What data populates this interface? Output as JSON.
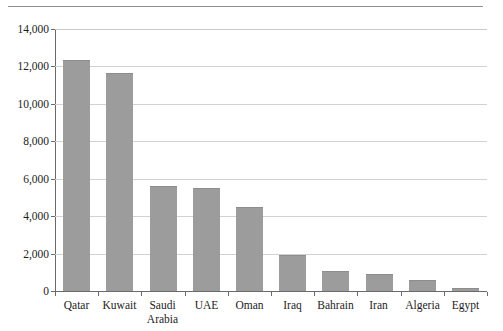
{
  "figure": {
    "has_top_rule": true,
    "background_color": "#ffffff",
    "bar_color": "#9c9c9c",
    "gridline_color": "#d2d2d2",
    "axis_color": "#6a6a6a"
  },
  "chart_data": {
    "type": "bar",
    "title": "",
    "subtitle": "",
    "xlabel": "",
    "ylabel": "",
    "categories": [
      "Qatar",
      "Kuwait",
      "Saudi\nArabia",
      "UAE",
      "Oman",
      "Iraq",
      "Bahrain",
      "Iran",
      "Algeria",
      "Egypt"
    ],
    "values": [
      12350,
      11650,
      5600,
      5480,
      4500,
      1950,
      1070,
      900,
      600,
      160
    ],
    "ylim": [
      0,
      14000
    ],
    "yticks": [
      0,
      2000,
      4000,
      6000,
      8000,
      10000,
      12000,
      14000
    ],
    "ytick_labels": [
      "0",
      "2,000",
      "4,000",
      "6,000",
      "8,000",
      "10,000",
      "12,000",
      "14,000"
    ],
    "grid": true,
    "legend": null,
    "legend_position": "none",
    "annotations": []
  }
}
